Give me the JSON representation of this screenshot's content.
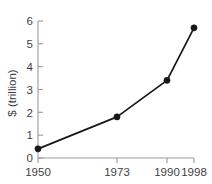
{
  "chart_data": {
    "type": "line",
    "title": "",
    "subtitle": "",
    "xlabel": "",
    "ylabel": "$ (trillion)",
    "x": [
      "1950",
      "1973",
      "1990",
      "1998"
    ],
    "categories": [
      "1950",
      "1973",
      "1990",
      "1998"
    ],
    "values": [
      0.4,
      1.8,
      3.4,
      5.7
    ],
    "series": [
      {
        "name": "",
        "values": [
          0.4,
          1.8,
          3.4,
          5.7
        ]
      }
    ],
    "xtick_labels": [
      "1950",
      "1973",
      "1990",
      "1998"
    ],
    "ytick_labels": [
      "0",
      "1",
      "2",
      "3",
      "4",
      "5",
      "6"
    ],
    "ytick_values": [
      0,
      1,
      2,
      3,
      4,
      5,
      6
    ],
    "ylim": [
      0,
      6
    ],
    "xlim": [
      1950,
      1998
    ],
    "grid": false,
    "legend": false,
    "legend_position": "none",
    "marker": "filled-circle",
    "line_color": "#17171a",
    "marker_color": "#17171a",
    "axis_color": "#9a9a9a",
    "background_color": "#ffffff",
    "annotations": []
  },
  "axes": {
    "y_title": "$ (trillion)",
    "y_ticks": [
      "0",
      "1",
      "2",
      "3",
      "4",
      "5",
      "6"
    ],
    "x_ticks": [
      "1950",
      "1973",
      "1990",
      "1998"
    ]
  }
}
